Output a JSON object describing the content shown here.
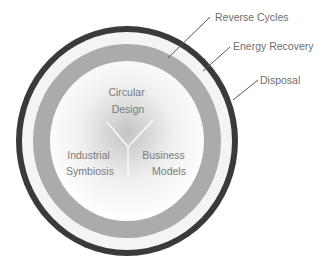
{
  "diagram": {
    "type": "concentric-rings",
    "rings": [
      {
        "name": "Disposal",
        "color": "#3a3a3a"
      },
      {
        "name": "Energy Recovery",
        "color": "#f4f4f4"
      },
      {
        "name": "Reverse Cycles",
        "color": "#ababab"
      }
    ],
    "core": {
      "fill_center": "#c4c4c4",
      "fill_edge": "#ffffff",
      "divider_color": "#ffffff",
      "sectors": [
        {
          "line1": "Circular",
          "line2": "Design"
        },
        {
          "line1": "Industrial",
          "line2": "Symbiosis"
        },
        {
          "line1": "Business",
          "line2": "Models"
        }
      ]
    },
    "callouts": [
      {
        "label": "Reverse Cycles"
      },
      {
        "label": "Energy Recovery"
      },
      {
        "label": "Disposal"
      }
    ],
    "leader_color": "#555555"
  }
}
